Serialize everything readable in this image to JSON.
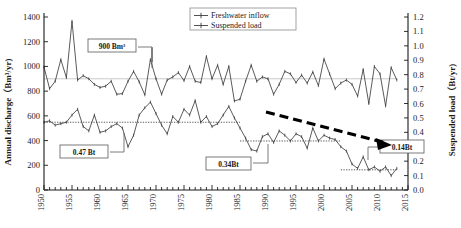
{
  "chart_data": {
    "type": "line",
    "title": "",
    "xlabel": "",
    "ylabel": "Annual discharge（Bm³/yr)",
    "y2label": "Suspended load（Bt/yr)",
    "xlim": [
      1950,
      2015
    ],
    "ylim": [
      0,
      1400
    ],
    "y2lim": [
      0.0,
      1.2
    ],
    "grid": false,
    "legend_position": "top-right",
    "x_ticks": [
      1950,
      1955,
      1960,
      1965,
      1970,
      1975,
      1980,
      1985,
      1990,
      1995,
      2000,
      2005,
      2010,
      2015
    ],
    "x_tick_labels": [
      "1950",
      "1955",
      "1960",
      "1965",
      "1970",
      "1975",
      "1980",
      "1985",
      "1990",
      "1995",
      "2000",
      "2005",
      "2010",
      "2015"
    ],
    "y_ticks": [
      0,
      200,
      400,
      600,
      800,
      1000,
      1200,
      1400
    ],
    "y_tick_labels": [
      "0",
      "200",
      "400",
      "600",
      "800",
      "1000",
      "1200",
      "1400"
    ],
    "y2_ticks": [
      0.0,
      0.1,
      0.2,
      0.3,
      0.4,
      0.5,
      0.6,
      0.7,
      0.8,
      0.9,
      1.0,
      1.1,
      1.2
    ],
    "y2_tick_labels": [
      "0.0",
      "0.1",
      "0.2",
      "0.3",
      "0.4",
      "0.5",
      "0.6",
      "0.7",
      "0.8",
      "0.9",
      "1.0",
      "1.1",
      "1.2"
    ],
    "x": [
      1950,
      1951,
      1952,
      1953,
      1954,
      1955,
      1956,
      1957,
      1958,
      1959,
      1960,
      1961,
      1962,
      1963,
      1964,
      1965,
      1966,
      1967,
      1968,
      1969,
      1970,
      1971,
      1972,
      1973,
      1974,
      1975,
      1976,
      1977,
      1978,
      1979,
      1980,
      1981,
      1982,
      1983,
      1984,
      1985,
      1986,
      1987,
      1988,
      1989,
      1990,
      1991,
      1992,
      1993,
      1994,
      1995,
      1996,
      1997,
      1998,
      1999,
      2000,
      2001,
      2002,
      2003,
      2004,
      2005,
      2006,
      2007,
      2008,
      2009,
      2010,
      2011,
      2012,
      2013
    ],
    "series": [
      {
        "name": "Freshwater inflow",
        "axis": "left",
        "units": "Bm³/yr",
        "mean": 900,
        "values": [
          995,
          820,
          880,
          1055,
          910,
          1365,
          890,
          925,
          900,
          855,
          830,
          840,
          880,
          775,
          780,
          880,
          960,
          875,
          770,
          1055,
          900,
          775,
          890,
          915,
          950,
          885,
          1000,
          880,
          870,
          1080,
          900,
          1010,
          855,
          1000,
          720,
          735,
          880,
          1010,
          880,
          915,
          900,
          775,
          855,
          960,
          940,
          870,
          930,
          865,
          955,
          845,
          1060,
          940,
          820,
          865,
          890,
          855,
          760,
          975,
          700,
          1000,
          940,
          680,
          990,
          890
        ]
      },
      {
        "name": "Suspended load",
        "axis": "right",
        "units": "Bt/yr",
        "mean_early": 0.47,
        "mean_mid": 0.34,
        "mean_late": 0.14,
        "values": [
          0.47,
          0.48,
          0.45,
          0.46,
          0.47,
          0.52,
          0.56,
          0.44,
          0.41,
          0.52,
          0.4,
          0.41,
          0.44,
          0.46,
          0.43,
          0.3,
          0.38,
          0.52,
          0.57,
          0.61,
          0.53,
          0.45,
          0.39,
          0.51,
          0.47,
          0.56,
          0.52,
          0.62,
          0.47,
          0.51,
          0.44,
          0.46,
          0.52,
          0.58,
          0.5,
          0.43,
          0.36,
          0.28,
          0.27,
          0.37,
          0.39,
          0.33,
          0.41,
          0.38,
          0.34,
          0.39,
          0.37,
          0.29,
          0.43,
          0.34,
          0.38,
          0.36,
          0.35,
          0.3,
          0.27,
          0.18,
          0.15,
          0.23,
          0.14,
          0.16,
          0.13,
          0.16,
          0.1,
          0.15
        ]
      }
    ],
    "reference_lines": [
      {
        "label": "900 Bm³",
        "axis": "left",
        "value": 900,
        "x_start": 1950,
        "x_end": 2013,
        "style": "solid-gray"
      },
      {
        "label": "0.47 Bt",
        "axis": "right",
        "value": 0.47,
        "x_start": 1950,
        "x_end": 1985,
        "style": "dotted"
      },
      {
        "label": "0.34Bt",
        "axis": "right",
        "value": 0.34,
        "x_start": 1985,
        "x_end": 2003,
        "style": "dotted"
      },
      {
        "label": "0.14Bt",
        "axis": "right",
        "value": 0.14,
        "x_start": 2003,
        "x_end": 2013,
        "style": "dotted"
      }
    ],
    "annotations": [
      {
        "name": "annotation-900bm3",
        "text": "900 Bm³"
      },
      {
        "name": "annotation-047bt",
        "text": "0.47 Bt"
      },
      {
        "name": "annotation-034bt",
        "text": "0.34Bt"
      },
      {
        "name": "annotation-014bt",
        "text": "0.14Bt"
      },
      {
        "name": "trend-arrow",
        "text": ""
      }
    ],
    "legend": [
      {
        "label": "Freshwater inflow",
        "marker": "line-with-cross"
      },
      {
        "label": "Suspended load",
        "marker": "line-with-cross"
      }
    ]
  }
}
